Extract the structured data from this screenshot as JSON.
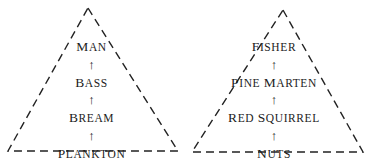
{
  "figure": {
    "background_color": "#ffffff",
    "line_color": "#222222",
    "text_color": "#1c1c1c",
    "line_style": "dashed"
  },
  "pyramids": [
    {
      "id": "aquatic",
      "apex_label": "",
      "levels": [
        {
          "initial": "M",
          "rest": "AN",
          "full": "Man"
        },
        {
          "initial": "B",
          "rest": "ASS",
          "full": "Bass"
        },
        {
          "initial": "B",
          "rest": "REAM",
          "full": "Bream"
        },
        {
          "initial": "P",
          "rest": "LANKTON",
          "full": "Plankton"
        }
      ],
      "arrows": [
        "↑",
        "↑",
        "↑"
      ],
      "arrow_direction": "up"
    },
    {
      "id": "woodland",
      "apex_label": "",
      "levels": [
        {
          "initial": "F",
          "rest": "ISHER",
          "full": "Fisher"
        },
        {
          "initial": "P",
          "rest": "INE ",
          "initial2": "M",
          "rest2": "ARTEN",
          "full": "Pine Marten"
        },
        {
          "initial": "R",
          "rest": "ED ",
          "initial2": "S",
          "rest2": "QUIRREL",
          "full": "Red Squirrel"
        },
        {
          "initial": "N",
          "rest": "UTS",
          "full": "Nuts"
        }
      ],
      "arrows": [
        "↑",
        "↑",
        "↑"
      ],
      "arrow_direction": "up"
    }
  ]
}
